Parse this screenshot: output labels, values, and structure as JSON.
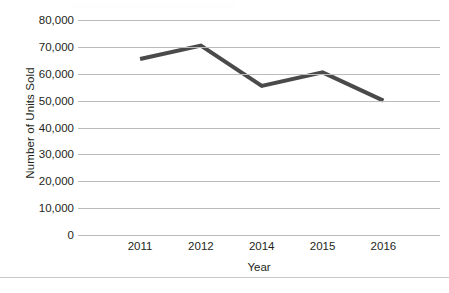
{
  "chart_data": {
    "type": "line",
    "title": "",
    "xlabel": "Year",
    "ylabel": "Number of Units Sold",
    "categories": [
      "2011",
      "2012",
      "2014",
      "2015",
      "2016"
    ],
    "values": [
      65500,
      70500,
      55500,
      60500,
      50000
    ],
    "series": [
      {
        "name": "Units Sold",
        "values": [
          65500,
          70500,
          55500,
          60500,
          50000
        ]
      }
    ],
    "ylim": [
      0,
      80000
    ],
    "ytick_values": [
      80000,
      70000,
      60000,
      50000,
      40000,
      30000,
      20000,
      10000,
      0
    ],
    "ytick_labels": [
      "80,000",
      "70,000",
      "60,000",
      "50,000",
      "40,000",
      "30,000",
      "20,000",
      "10,000",
      "0"
    ],
    "xtick_labels": [
      "2011",
      "2012",
      "2014",
      "2015",
      "2016"
    ],
    "grid": "horizontal",
    "legend": "none",
    "annotations": [],
    "colors": {
      "series_line": "#4a4a4a",
      "gridline": "#bcbcbc",
      "text": "#231f20",
      "background": "#ffffff",
      "divider": "#c9c9c9"
    },
    "line_width": 4
  }
}
